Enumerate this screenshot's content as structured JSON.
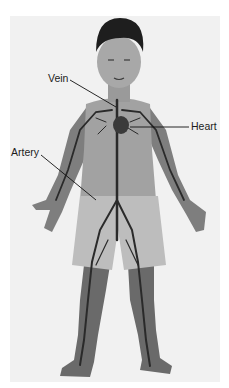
{
  "diagram": {
    "labels": [
      {
        "id": "vein",
        "text": "Vein"
      },
      {
        "id": "heart",
        "text": "Heart"
      },
      {
        "id": "artery",
        "text": "Artery"
      }
    ],
    "colors": {
      "background": "#ffffff",
      "photo_background": "#f1f1f1",
      "skin": "#9a9a9a",
      "hair": "#1e1e1e",
      "shorts": "#bdbdbd",
      "vessels": "#2a2a2a",
      "label_text": "#1c1c1c"
    }
  }
}
